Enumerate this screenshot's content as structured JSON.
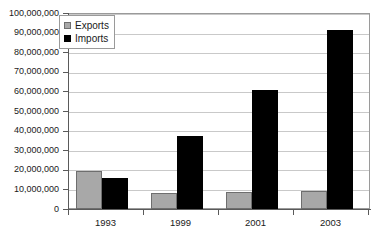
{
  "chart_data": {
    "type": "bar",
    "title": "",
    "subtitle": "",
    "xlabel": "",
    "ylabel": "",
    "categories": [
      "1993",
      "1999",
      "2001",
      "2003"
    ],
    "series": [
      {
        "name": "Exports",
        "color": "#a8a8a8",
        "values": [
          19500000,
          8000000,
          8500000,
          9000000
        ]
      },
      {
        "name": "Imports",
        "color": "#000000",
        "values": [
          16000000,
          37500000,
          61000000,
          92000000
        ]
      }
    ],
    "ylim": [
      0,
      100000000
    ],
    "ytick_values": [
      0,
      10000000,
      20000000,
      30000000,
      40000000,
      50000000,
      60000000,
      70000000,
      80000000,
      90000000,
      100000000
    ],
    "ytick_labels": [
      "0",
      "10,000,000",
      "20,000,000",
      "30,000,000",
      "40,000,000",
      "50,000,000",
      "60,000,000",
      "70,000,000",
      "80,000,000",
      "90,000,000",
      "100,000,000"
    ],
    "grid": true,
    "grid_axis": "y",
    "legend": {
      "position": "top-left-inside",
      "entries": [
        {
          "label": "Exports",
          "swatch": "exports-swatch"
        },
        {
          "label": "Imports",
          "swatch": "imports-swatch"
        }
      ]
    }
  }
}
